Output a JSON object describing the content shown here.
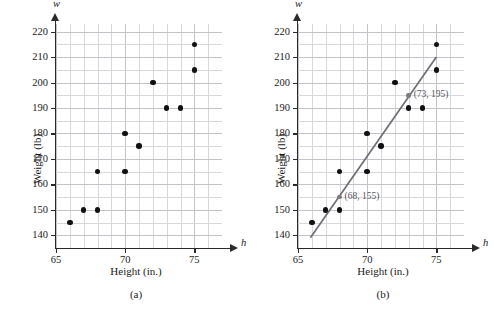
{
  "figure": {
    "panels": [
      {
        "key": "a",
        "caption": "(a)",
        "xtitle": "Height (in.)",
        "ytitle": "Weight (lb)",
        "x_var": "h",
        "y_var": "w"
      },
      {
        "key": "b",
        "caption": "(b)",
        "xtitle": "Height (in.)",
        "ytitle": "Weight (lb)",
        "x_var": "h",
        "y_var": "w"
      }
    ],
    "colors": {
      "dot": "#111111",
      "grid": "#d8d8dc",
      "grid_major": "#c2c2c8",
      "axis": "#2a2a2a",
      "trend_line": "#6e6e76",
      "annotation": "#55555c"
    }
  },
  "chart_data": [
    {
      "type": "scatter",
      "panel": "(a)",
      "title": "",
      "xlabel": "Height (in.)",
      "ylabel": "Weight (lb)",
      "x_symbol": "h",
      "y_symbol": "w",
      "xlim": [
        65,
        77
      ],
      "ylim": [
        135,
        223
      ],
      "xticks": [
        65,
        70,
        75
      ],
      "xtick_labels": [
        "65",
        "70",
        "75"
      ],
      "yticks": [
        140,
        150,
        160,
        170,
        180,
        190,
        200,
        210,
        220
      ],
      "ytick_labels": [
        "140",
        "150",
        "160",
        "170",
        "180",
        "190",
        "200",
        "210",
        "220"
      ],
      "x_minor_step": 1,
      "y_minor_step": 5,
      "grid": true,
      "legend": false,
      "x": [
        66,
        67,
        68,
        68,
        70,
        70,
        71,
        72,
        73,
        74,
        75,
        75
      ],
      "y": [
        145,
        150,
        150,
        165,
        165,
        180,
        175,
        200,
        190,
        190,
        205,
        215
      ],
      "points": [
        [
          66,
          145
        ],
        [
          67,
          150
        ],
        [
          68,
          150
        ],
        [
          68,
          165
        ],
        [
          70,
          165
        ],
        [
          70,
          180
        ],
        [
          71,
          175
        ],
        [
          72,
          200
        ],
        [
          73,
          190
        ],
        [
          74,
          190
        ],
        [
          75,
          205
        ],
        [
          75,
          215
        ]
      ]
    },
    {
      "type": "scatter",
      "panel": "(b)",
      "title": "",
      "xlabel": "Height (in.)",
      "ylabel": "Weight (lb)",
      "x_symbol": "h",
      "y_symbol": "w",
      "xlim": [
        65,
        77
      ],
      "ylim": [
        135,
        223
      ],
      "xticks": [
        65,
        70,
        75
      ],
      "xtick_labels": [
        "65",
        "70",
        "75"
      ],
      "yticks": [
        140,
        150,
        160,
        170,
        180,
        190,
        200,
        210,
        220
      ],
      "ytick_labels": [
        "140",
        "150",
        "160",
        "170",
        "180",
        "190",
        "200",
        "210",
        "220"
      ],
      "x_minor_step": 1,
      "y_minor_step": 5,
      "grid": true,
      "legend": false,
      "x": [
        66,
        67,
        68,
        68,
        70,
        70,
        71,
        72,
        73,
        74,
        75,
        75
      ],
      "y": [
        145,
        150,
        150,
        165,
        165,
        180,
        175,
        200,
        190,
        190,
        205,
        215
      ],
      "points": [
        [
          66,
          145
        ],
        [
          67,
          150
        ],
        [
          68,
          150
        ],
        [
          68,
          165
        ],
        [
          70,
          165
        ],
        [
          70,
          180
        ],
        [
          71,
          175
        ],
        [
          72,
          200
        ],
        [
          73,
          190
        ],
        [
          74,
          190
        ],
        [
          75,
          205
        ],
        [
          75,
          215
        ]
      ],
      "series": [
        {
          "name": "trend line",
          "type": "line",
          "from": [
            65.9,
            139
          ],
          "to": [
            75.0,
            210
          ]
        }
      ],
      "annotations": [
        {
          "label": "(68, 155)",
          "x": 68,
          "y": 155
        },
        {
          "label": "(73, 195)",
          "x": 73,
          "y": 195
        }
      ]
    }
  ]
}
